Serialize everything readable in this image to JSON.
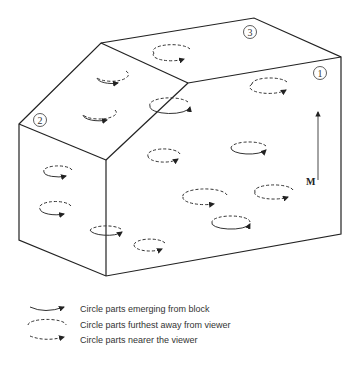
{
  "diagram": {
    "face_labels": [
      "1",
      "2",
      "3"
    ],
    "vector_label": "M",
    "legend": [
      {
        "style": "solid-arrow",
        "label": "Circle parts emerging from block"
      },
      {
        "style": "dashed-ellipse",
        "label": "Circle parts furthest away from viewer"
      },
      {
        "style": "dashed-arrow",
        "label": "Circle parts nearer the viewer"
      }
    ],
    "colors": {
      "line": "#222222",
      "background": "#ffffff"
    }
  }
}
